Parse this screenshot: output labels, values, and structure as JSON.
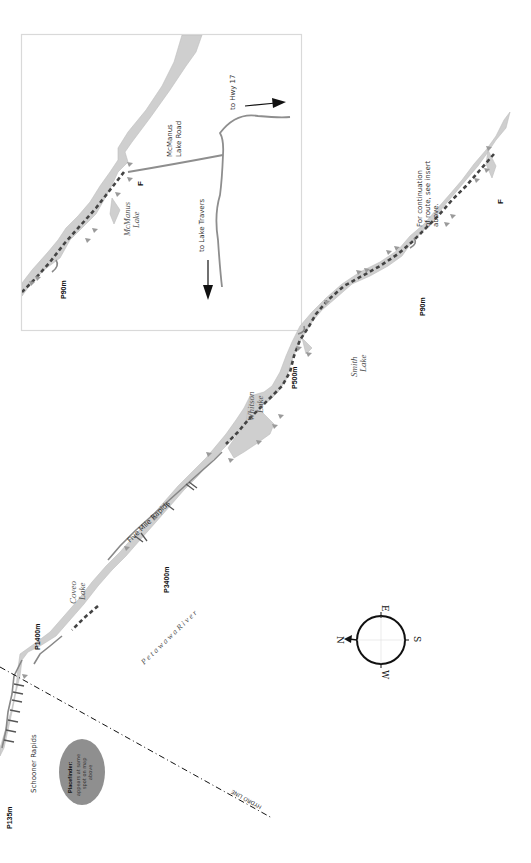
{
  "map": {
    "title": "Petawawa River canoe route",
    "colors": {
      "water": "#cfcfcf",
      "route": "#444444",
      "road": "#8e8e8e",
      "inset_border": "#d9d9d9",
      "placefinder_fill": "#8f8f8f"
    },
    "inset": {
      "lake_label_1": "McManus",
      "lake_label_2": "Lake",
      "finish_marker": "F",
      "portage_label": "P90m",
      "road_label_1": "McManus",
      "road_label_2": "Lake Road",
      "direction_hwy": "to Hwy 17",
      "direction_travers": "to Lake Travers"
    },
    "main": {
      "continuation_note_1": "For continuation",
      "continuation_note_2": "of route, see insert",
      "continuation_note_3": "above.",
      "finish_marker": "F",
      "portages": {
        "p90": "P90m",
        "p500": "P500m",
        "p3400": "P3400m",
        "p1400": "P1400m",
        "p135": "P135m"
      },
      "lakes": {
        "smith_1": "Smith",
        "smith_2": "Lake",
        "whitson_1": "Whitson",
        "whitson_2": "Lake",
        "coveo_1": "Coveo",
        "coveo_2": "Lake"
      },
      "rapids": {
        "five_mile": "Five Mile Rapids",
        "schooner": "Schooner Rapids"
      },
      "river_name": "P e t a w a w a   R i v e r",
      "hydro_line": "HYDRO LINE",
      "placefinder": {
        "title": "Placefinder:",
        "line_1": "appears at same",
        "line_2": "spot on map",
        "line_3": "above"
      }
    },
    "compass": {
      "north": "N",
      "east": "E",
      "south": "S",
      "west": "W"
    }
  }
}
